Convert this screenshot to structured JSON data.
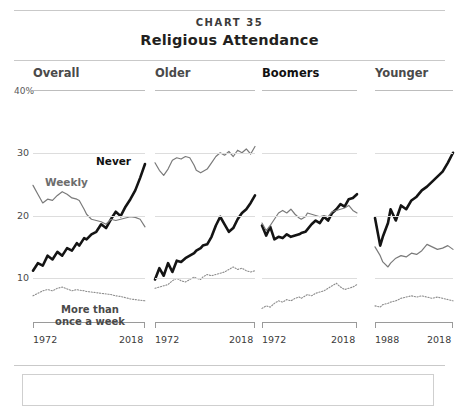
{
  "header": {
    "kicker": "CHART 35",
    "title": "Religious Attendance"
  },
  "axis": {
    "unit_label": "40%",
    "yticks": [
      "30",
      "20",
      "10"
    ],
    "ytick_values": [
      30,
      20,
      10
    ],
    "ymax_label_value": 40
  },
  "panels": [
    {
      "title": "Overall",
      "emphasis": false,
      "x_start_label": "1972",
      "x_end_label": "2018"
    },
    {
      "title": "Older",
      "emphasis": false,
      "x_start_label": "1972",
      "x_end_label": "2018"
    },
    {
      "title": "Boomers",
      "emphasis": true,
      "x_start_label": "1972",
      "x_end_label": "2018"
    },
    {
      "title": "Younger",
      "emphasis": false,
      "x_start_label": "1988",
      "x_end_label": "2018"
    }
  ],
  "series_labels": {
    "never": "Never",
    "weekly": "Weekly",
    "more_than_once_line1": "More than",
    "more_than_once_line2": "once a week"
  },
  "colors": {
    "never": "#141414",
    "weekly": "#7a7a7a",
    "more_than_once": "#8c8c8c",
    "gridline": "#dddddd",
    "rule": "#c9c9c9",
    "text": "#231f20"
  },
  "chart_data": {
    "type": "line",
    "title": "Religious Attendance",
    "subtitle": "CHART 35",
    "xlabel": "",
    "ylabel": "Percent",
    "ylim": [
      0,
      40
    ],
    "yticks": [
      10,
      20,
      30,
      40
    ],
    "grid": true,
    "legend": "inline annotations",
    "panels": [
      {
        "name": "Overall",
        "xlim": [
          1972,
          2018
        ],
        "series": [
          {
            "name": "Never",
            "style": "thick-solid-black",
            "x": [
              1972,
              1974,
              1976,
              1978,
              1980,
              1982,
              1984,
              1986,
              1988,
              1990,
              1991,
              1993,
              1994,
              1996,
              1998,
              2000,
              2002,
              2004,
              2006,
              2008,
              2010,
              2012,
              2014,
              2016,
              2018
            ],
            "values": [
              11.2,
              12.4,
              12.0,
              13.6,
              13.0,
              14.2,
              13.6,
              14.8,
              14.4,
              15.6,
              15.2,
              16.4,
              16.2,
              17.0,
              17.4,
              18.6,
              18.0,
              19.4,
              20.6,
              19.9,
              21.4,
              22.6,
              24.0,
              26.0,
              28.2
            ]
          },
          {
            "name": "Weekly",
            "style": "thin-solid-gray",
            "x": [
              1972,
              1974,
              1976,
              1978,
              1980,
              1982,
              1984,
              1986,
              1988,
              1990,
              1991,
              1993,
              1994,
              1996,
              1998,
              2000,
              2002,
              2004,
              2006,
              2008,
              2010,
              2012,
              2014,
              2016,
              2018
            ],
            "values": [
              24.8,
              23.4,
              22.0,
              22.6,
              22.4,
              23.2,
              23.8,
              23.4,
              22.8,
              22.6,
              22.4,
              21.0,
              20.2,
              19.4,
              19.2,
              19.0,
              18.6,
              19.4,
              19.2,
              19.4,
              19.6,
              19.8,
              19.7,
              19.4,
              18.2
            ]
          },
          {
            "name": "More than once a week",
            "style": "dotted-gray",
            "x": [
              1972,
              1974,
              1976,
              1978,
              1980,
              1982,
              1984,
              1986,
              1988,
              1990,
              1991,
              1993,
              1994,
              1996,
              1998,
              2000,
              2002,
              2004,
              2006,
              2008,
              2010,
              2012,
              2014,
              2016,
              2018
            ],
            "values": [
              7.2,
              7.6,
              8.0,
              8.2,
              8.0,
              8.4,
              8.6,
              8.3,
              8.0,
              8.2,
              8.1,
              8.0,
              7.9,
              7.8,
              7.7,
              7.6,
              7.5,
              7.4,
              7.2,
              7.1,
              6.9,
              6.7,
              6.6,
              6.5,
              6.4
            ]
          }
        ]
      },
      {
        "name": "Older",
        "xlim": [
          1972,
          2018
        ],
        "series": [
          {
            "name": "Never",
            "style": "thick-solid-black",
            "x": [
              1972,
              1974,
              1976,
              1978,
              1980,
              1982,
              1984,
              1986,
              1988,
              1990,
              1991,
              1993,
              1994,
              1996,
              1998,
              2000,
              2002,
              2004,
              2006,
              2008,
              2010,
              2012,
              2014,
              2016,
              2018
            ],
            "values": [
              9.8,
              11.6,
              10.4,
              12.4,
              11.0,
              12.8,
              12.6,
              13.2,
              13.6,
              14.0,
              14.4,
              14.8,
              15.2,
              15.4,
              16.6,
              18.4,
              19.8,
              18.6,
              17.4,
              18.0,
              19.4,
              20.4,
              21.0,
              22.0,
              23.2
            ]
          },
          {
            "name": "Weekly",
            "style": "thin-solid-gray",
            "x": [
              1972,
              1974,
              1976,
              1978,
              1980,
              1982,
              1984,
              1986,
              1988,
              1990,
              1991,
              1993,
              1994,
              1996,
              1998,
              2000,
              2002,
              2004,
              2006,
              2008,
              2010,
              2012,
              2014,
              2016,
              2018
            ],
            "values": [
              28.4,
              27.2,
              26.4,
              27.4,
              28.8,
              29.2,
              29.0,
              29.4,
              29.2,
              28.0,
              27.2,
              26.8,
              27.0,
              27.4,
              28.4,
              29.4,
              30.0,
              29.6,
              30.2,
              29.4,
              30.4,
              30.0,
              30.6,
              29.8,
              31.0
            ]
          },
          {
            "name": "More than once a week",
            "style": "dotted-gray",
            "x": [
              1972,
              1974,
              1976,
              1978,
              1980,
              1982,
              1984,
              1986,
              1988,
              1990,
              1991,
              1993,
              1994,
              1996,
              1998,
              2000,
              2002,
              2004,
              2006,
              2008,
              2010,
              2012,
              2014,
              2016,
              2018
            ],
            "values": [
              8.4,
              8.6,
              8.8,
              9.0,
              9.6,
              10.0,
              9.6,
              9.4,
              9.8,
              10.2,
              10.0,
              9.8,
              10.2,
              10.6,
              10.4,
              10.6,
              10.8,
              11.0,
              11.4,
              11.8,
              11.4,
              11.6,
              11.2,
              11.0,
              11.2
            ]
          }
        ]
      },
      {
        "name": "Boomers",
        "xlim": [
          1972,
          2018
        ],
        "series": [
          {
            "name": "Never",
            "style": "thick-solid-black",
            "x": [
              1972,
              1974,
              1976,
              1978,
              1980,
              1982,
              1984,
              1986,
              1988,
              1990,
              1991,
              1993,
              1994,
              1996,
              1998,
              2000,
              2002,
              2004,
              2006,
              2008,
              2010,
              2012,
              2014,
              2016,
              2018
            ],
            "values": [
              18.4,
              16.8,
              18.2,
              16.2,
              16.6,
              16.4,
              17.0,
              16.6,
              16.8,
              17.0,
              17.2,
              17.4,
              17.8,
              18.6,
              19.2,
              18.8,
              19.8,
              19.2,
              20.4,
              21.0,
              21.8,
              21.4,
              22.6,
              22.8,
              23.4
            ]
          },
          {
            "name": "Weekly",
            "style": "thin-solid-gray",
            "x": [
              1972,
              1974,
              1976,
              1978,
              1980,
              1982,
              1984,
              1986,
              1988,
              1990,
              1991,
              1993,
              1994,
              1996,
              1998,
              2000,
              2002,
              2004,
              2006,
              2008,
              2010,
              2012,
              2014,
              2016,
              2018
            ],
            "values": [
              18.8,
              17.6,
              18.4,
              19.4,
              20.4,
              20.8,
              20.4,
              21.0,
              20.2,
              19.6,
              19.4,
              19.8,
              20.4,
              20.2,
              20.0,
              19.8,
              20.0,
              19.8,
              20.6,
              20.8,
              21.0,
              21.2,
              21.6,
              20.8,
              20.4
            ]
          },
          {
            "name": "More than once a week",
            "style": "dotted-gray",
            "x": [
              1972,
              1974,
              1976,
              1978,
              1980,
              1982,
              1984,
              1986,
              1988,
              1990,
              1991,
              1993,
              1994,
              1996,
              1998,
              2000,
              2002,
              2004,
              2006,
              2008,
              2010,
              2012,
              2014,
              2016,
              2018
            ],
            "values": [
              5.2,
              5.6,
              5.4,
              6.0,
              6.4,
              6.2,
              6.6,
              6.4,
              6.8,
              7.0,
              6.8,
              7.2,
              7.4,
              7.2,
              7.6,
              7.8,
              8.0,
              8.4,
              8.8,
              9.2,
              8.6,
              8.2,
              8.4,
              8.6,
              9.0
            ]
          }
        ]
      },
      {
        "name": "Younger",
        "xlim": [
          1988,
          2018
        ],
        "series": [
          {
            "name": "Never",
            "style": "thick-solid-black",
            "x": [
              1988,
              1990,
              1991,
              1993,
              1994,
              1996,
              1998,
              2000,
              2002,
              2004,
              2006,
              2008,
              2010,
              2012,
              2014,
              2016,
              2018
            ],
            "values": [
              19.6,
              15.2,
              16.6,
              18.8,
              21.0,
              19.2,
              21.6,
              21.0,
              22.4,
              23.0,
              24.0,
              24.6,
              25.4,
              26.2,
              27.0,
              28.4,
              30.0
            ]
          },
          {
            "name": "Weekly",
            "style": "thin-solid-gray",
            "x": [
              1988,
              1990,
              1991,
              1993,
              1994,
              1996,
              1998,
              2000,
              2002,
              2004,
              2006,
              2008,
              2010,
              2012,
              2014,
              2016,
              2018
            ],
            "values": [
              15.0,
              13.6,
              12.6,
              11.8,
              12.4,
              13.2,
              13.6,
              13.4,
              14.0,
              13.8,
              14.4,
              15.4,
              15.0,
              14.6,
              14.8,
              15.2,
              14.6
            ]
          },
          {
            "name": "More than once a week",
            "style": "dotted-gray",
            "x": [
              1988,
              1990,
              1991,
              1993,
              1994,
              1996,
              1998,
              2000,
              2002,
              2004,
              2006,
              2008,
              2010,
              2012,
              2014,
              2016,
              2018
            ],
            "values": [
              5.6,
              5.4,
              5.8,
              6.0,
              6.2,
              6.4,
              6.8,
              7.0,
              7.2,
              7.0,
              7.2,
              7.0,
              6.8,
              7.0,
              6.8,
              6.6,
              6.4
            ]
          }
        ]
      }
    ]
  }
}
